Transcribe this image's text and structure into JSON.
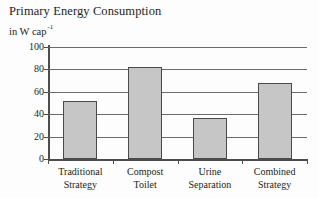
{
  "chart_data": {
    "type": "bar",
    "title": "Primary Energy Consumption",
    "subtitle_main": "in W cap",
    "subtitle_exponent": "-1",
    "ylabel": "",
    "xlabel": "",
    "ylim": [
      0,
      100
    ],
    "yticks": [
      "100",
      "80",
      "60",
      "40",
      "20",
      "0"
    ],
    "ytick_values": [
      100,
      80,
      60,
      40,
      20,
      0
    ],
    "grid": "horizontal",
    "legend": "none",
    "categories": [
      "Traditional Strategy",
      "Compost Toilet",
      "Urine Separation",
      "Combined Strategy"
    ],
    "category_lines": [
      {
        "line1": "Traditional",
        "line2": "Strategy"
      },
      {
        "line1": "Compost",
        "line2": "Toilet"
      },
      {
        "line1": "Urine",
        "line2": "Separation"
      },
      {
        "line1": "Combined",
        "line2": "Strategy"
      }
    ],
    "values": [
      52,
      82,
      37,
      68
    ],
    "bar_color": "#c6c6c6",
    "bar_edge_color": "#4a4a4a",
    "axis_color": "#4d4d4d",
    "grid_color": "#6b6b6b",
    "text_color": "#231f20"
  }
}
